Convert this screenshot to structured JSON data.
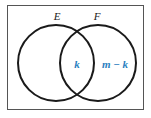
{
  "diagram": {
    "type": "venn",
    "sets": [
      {
        "name": "E"
      },
      {
        "name": "F"
      }
    ],
    "regions": {
      "intersection": "k",
      "f_only": "m − k"
    },
    "colors": {
      "stroke": "#1a1a1a",
      "frame": "#555555",
      "region_label": "#2a7fc0"
    }
  }
}
